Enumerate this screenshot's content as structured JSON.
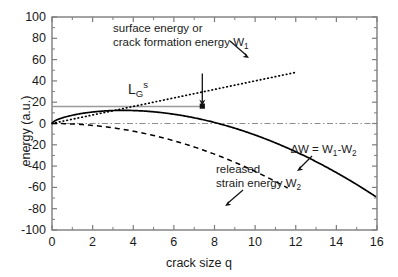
{
  "chart_data": {
    "type": "line",
    "title": "",
    "xlabel": "crack size q",
    "ylabel": "energy (a.u.)",
    "xlim": [
      0,
      16
    ],
    "ylim": [
      -100,
      100
    ],
    "xticks": [
      "0",
      "2",
      "4",
      "6",
      "8",
      "10",
      "12",
      "14",
      "16"
    ],
    "yticks": [
      "100",
      "80",
      "60",
      "40",
      "20",
      "0",
      "-20",
      "-40",
      "-60",
      "-80",
      "-100"
    ],
    "xtick_values": [
      0,
      2,
      4,
      6,
      8,
      10,
      12,
      14,
      16
    ],
    "ytick_values": [
      100,
      80,
      60,
      40,
      20,
      0,
      -20,
      -40,
      -60,
      -80,
      -100
    ],
    "grid": false,
    "legend": "none",
    "series": [
      {
        "name": "surface energy or crack formation energy W1",
        "style": "dotted",
        "color": "#000000",
        "x": [
          0,
          0.5,
          1,
          1.5,
          2,
          2.5,
          3,
          3.5,
          4,
          4.5,
          5,
          5.5,
          6,
          6.5,
          7,
          7.5,
          8,
          8.5,
          9,
          9.5,
          10,
          10.5,
          11,
          11.5,
          12
        ],
        "y": [
          0,
          2,
          4,
          6,
          8,
          10,
          12,
          14,
          16,
          18,
          20,
          22,
          24,
          26,
          28,
          30,
          32,
          34,
          36,
          38,
          40,
          42,
          44,
          46,
          48
        ]
      },
      {
        "name": "released strain energy W2",
        "style": "dashed",
        "color": "#000000",
        "x": [
          0,
          1,
          2,
          3,
          4,
          5,
          6,
          7,
          8,
          9,
          10,
          11
        ],
        "y": [
          0,
          -0.45,
          -1.8,
          -4.05,
          -7.2,
          -11.25,
          -16.2,
          -22.05,
          -28.8,
          -36.45,
          -45,
          -54.45
        ]
      },
      {
        "name": "delta W = W1 - W2",
        "style": "solid",
        "color": "#000000",
        "x": [
          0,
          1,
          2,
          3,
          4,
          5,
          6,
          7,
          8,
          9,
          10,
          11,
          12,
          13,
          14,
          14.72
        ],
        "y": [
          0,
          3.55,
          6.2,
          7.95,
          8.8,
          8.75,
          7.8,
          5.95,
          3.2,
          -0.45,
          -5,
          -10.45,
          -16.8,
          -24.05,
          -32.2,
          -100
        ]
      },
      {
        "name": "LG s reference level",
        "style": "solid-gray",
        "color": "#9a9a9a",
        "x": [
          0,
          7.4
        ],
        "y": [
          16,
          16
        ]
      },
      {
        "name": "zero reference line",
        "style": "dash-dot",
        "color": "#808080",
        "x": [
          0,
          16
        ],
        "y": [
          0,
          0
        ]
      }
    ],
    "annotations": [
      {
        "name": "w1-label",
        "line1": "surface energy or",
        "line2_pre": "crack formation energy W",
        "line2_sub": "1"
      },
      {
        "name": "w2-label",
        "line1": "released",
        "line2_pre": "strain energy W",
        "line2_sub": "2"
      },
      {
        "name": "delta-w-label",
        "pre": "∆W = W",
        "sub1": "1",
        "mid": "-W",
        "sub2": "2"
      },
      {
        "name": "lg-s-label",
        "base": "L",
        "sub": "G",
        "sup": "s"
      }
    ]
  },
  "axes": {
    "x_title": "crack size q",
    "y_title": "energy (a.u.)"
  },
  "colors": {
    "axis": "#7d7d7d",
    "curve": "#000000",
    "gray_level": "#9a9a9a",
    "zero_line": "#8c8c8c",
    "text": "#1a1a1a"
  }
}
